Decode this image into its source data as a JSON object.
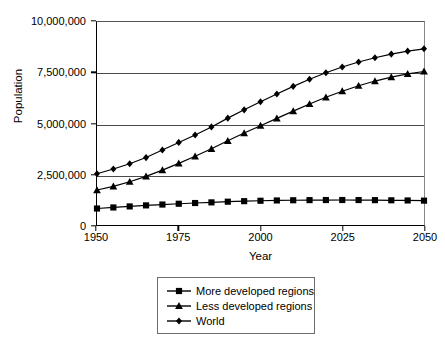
{
  "chart_data": {
    "type": "line",
    "title": "",
    "xlabel": "Year",
    "ylabel": "Population",
    "xlim": [
      1950,
      2050
    ],
    "ylim": [
      0,
      10000000
    ],
    "grid": true,
    "legend_position": "bottom-center",
    "y_ticks": [
      0,
      2500000,
      5000000,
      7500000,
      10000000
    ],
    "y_ticklabels": [
      "0",
      "2,500,000",
      "5,000,000",
      "7,500,000",
      "10,000,000"
    ],
    "x_ticks": [
      1950,
      1975,
      2000,
      2025,
      2050
    ],
    "x_ticklabels": [
      "1950",
      "1975",
      "2000",
      "2025",
      "2050"
    ],
    "x": [
      1950,
      1955,
      1960,
      1965,
      1970,
      1975,
      1980,
      1985,
      1990,
      1995,
      2000,
      2005,
      2010,
      2015,
      2020,
      2025,
      2030,
      2035,
      2040,
      2045,
      2050
    ],
    "series": [
      {
        "name": "More developed regions",
        "marker": "square",
        "values": [
          812000,
          864000,
          915000,
          966000,
          1008000,
          1047000,
          1083000,
          1115000,
          1148000,
          1174000,
          1194000,
          1209000,
          1219000,
          1226000,
          1230000,
          1231000,
          1229000,
          1224000,
          1217000,
          1209000,
          1200000
        ]
      },
      {
        "name": "Less developed regions",
        "marker": "triangle",
        "values": [
          1722000,
          1903000,
          2129000,
          2397000,
          2705000,
          3036000,
          3383000,
          3753000,
          4148000,
          4530000,
          4892000,
          5253000,
          5611000,
          5960000,
          6290000,
          6591000,
          6859000,
          7091000,
          7286000,
          7443000,
          7563000
        ]
      },
      {
        "name": "World",
        "marker": "diamond",
        "values": [
          2525000,
          2758000,
          3018000,
          3322000,
          3692000,
          4068000,
          4435000,
          4831000,
          5264000,
          5674000,
          6071000,
          6456000,
          6830000,
          7182000,
          7502000,
          7785000,
          8031000,
          8241000,
          8418000,
          8563000,
          8680000
        ]
      }
    ]
  },
  "axes": {
    "y_title": "Population",
    "x_title": "Year"
  },
  "legend": {
    "items": [
      {
        "label": "More developed regions",
        "marker": "square-marker"
      },
      {
        "label": "Less developed regions",
        "marker": "triangle-marker"
      },
      {
        "label": "World",
        "marker": "diamond-marker"
      }
    ]
  },
  "colors": {
    "line": "#000000",
    "marker": "#000000",
    "gridline": "#4a4a4a",
    "axis": "#000000",
    "background": "#ffffff",
    "legend_border": "#6b6b6b"
  }
}
